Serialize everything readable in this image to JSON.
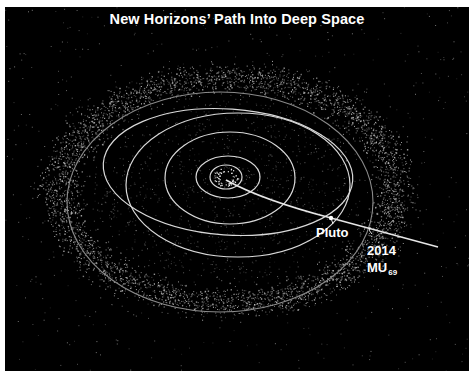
{
  "title": "New Horizons’ Path Into Deep Space",
  "colors": {
    "background": "#000000",
    "border": "#ffffff",
    "orbit": "#d9d9d9",
    "outer_orbit": "#8a8a8a",
    "trajectory": "#e6e6e6",
    "text": "#ffffff",
    "dust": "#cfcfcf"
  },
  "system_center": {
    "x": 226,
    "y": 177
  },
  "orbits": [
    {
      "name": "inner-planets-orbit",
      "cx": 226,
      "cy": 177,
      "rx": 16,
      "ry": 12,
      "rotate": 0,
      "style": "bright"
    },
    {
      "name": "jupiter-orbit",
      "cx": 228,
      "cy": 177,
      "rx": 32,
      "ry": 21,
      "rotate": 0,
      "style": "bright"
    },
    {
      "name": "saturn-orbit",
      "cx": 230,
      "cy": 178,
      "rx": 65,
      "ry": 46,
      "rotate": 0,
      "style": "bright"
    },
    {
      "name": "uranus-orbit",
      "cx": 238,
      "cy": 185,
      "rx": 112,
      "ry": 72,
      "rotate": 0,
      "style": "bright"
    },
    {
      "name": "neptune-orbit",
      "cx": 228,
      "cy": 172,
      "rx": 125,
      "ry": 63,
      "rotate": 4,
      "style": "bright"
    },
    {
      "name": "kuiper-outer-orbit",
      "cx": 220,
      "cy": 202,
      "rx": 153,
      "ry": 110,
      "rotate": 0,
      "style": "faint"
    }
  ],
  "trajectory": {
    "path": "M 226 180 Q 262 200 331 218 L 438 247"
  },
  "markers": {
    "pluto": {
      "label": "Pluto",
      "x": 331,
      "y": 218,
      "label_x": 316,
      "label_y": 226
    },
    "mu69": {
      "label_main": "2014",
      "label_line2": "MU",
      "subscript": "69",
      "x": 370,
      "y": 229,
      "label_x": 367,
      "label_y": 242
    }
  },
  "belt": {
    "cx": 228,
    "cy": 190,
    "inner_rx": 135,
    "inner_ry": 90,
    "outer_rx": 200,
    "outer_ry": 135,
    "density": 4200,
    "seed": 7
  }
}
